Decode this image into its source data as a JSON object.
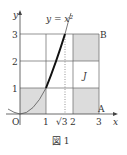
{
  "figure": {
    "caption": "図 1",
    "curve_label": "y = x²",
    "axis_x_label": "x",
    "axis_y_label": "y",
    "origin_label": "O",
    "point_a": "A",
    "point_b": "B",
    "region_label": "J",
    "x_ticks": [
      "1",
      "√3",
      "2",
      "3"
    ],
    "y_ticks": [
      "1",
      "2",
      "3"
    ],
    "shaded_color": "#dcdcdc"
  }
}
